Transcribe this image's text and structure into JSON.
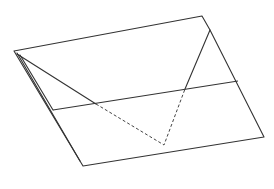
{
  "diagram": {
    "type": "origami-fold-step",
    "stroke_color": "#333333",
    "background": "#ffffff",
    "outline": [
      [
        14,
        51
      ],
      [
        202,
        16
      ],
      [
        210,
        30
      ],
      [
        264,
        137
      ],
      [
        83,
        166
      ],
      [
        14,
        51
      ]
    ],
    "inner_left_edges": [
      [
        [
          17,
          53
        ],
        [
          78,
          158
        ]
      ],
      [
        [
          20,
          55
        ],
        [
          53,
          110
        ]
      ]
    ],
    "horizontal_crease": [
      [
        53,
        110
      ],
      [
        238,
        81
      ]
    ],
    "flap_solid_left": [
      [
        17,
        54
      ],
      [
        96,
        104
      ]
    ],
    "flap_hidden": [
      [
        96,
        104
      ],
      [
        164,
        145
      ],
      [
        185,
        89
      ]
    ],
    "flap_solid_right": [
      [
        185,
        89
      ],
      [
        210,
        30
      ]
    ]
  }
}
